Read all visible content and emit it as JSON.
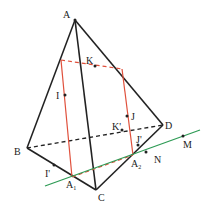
{
  "diagram": {
    "type": "tetrahedron-section",
    "colors": {
      "edges": "#222222",
      "section": "#e0503c",
      "line": "#2e9b55"
    },
    "labels": {
      "A": "A",
      "B": "B",
      "C": "C",
      "D": "D",
      "K": "K",
      "I": "I",
      "J": "J",
      "K_prime": "K'",
      "J_prime": "J'",
      "I_prime": "I'",
      "A1": "A",
      "A1_sub": "1",
      "A2": "A",
      "A2_sub": "2",
      "M": "M",
      "N": "N"
    }
  }
}
